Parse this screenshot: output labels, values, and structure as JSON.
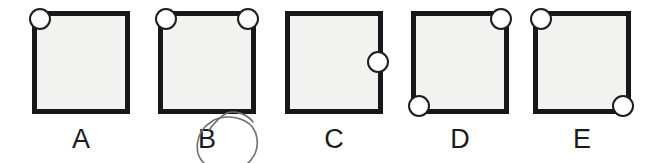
{
  "figure": {
    "type": "multiple-choice-diagram",
    "background_color": "#ffffff",
    "square": {
      "fill_color": "#f2f2f0",
      "border_color": "#18181a",
      "border_width_px": 5,
      "width_px": 98,
      "height_px": 103
    },
    "circle": {
      "fill_color": "#ffffff",
      "border_color": "#1d1d1f",
      "diameter_px": 22
    },
    "annotation": {
      "name": "hand-drawn-ellipse",
      "target_option": "B",
      "stroke_color": "#6f6f73",
      "stroke_width_px": 1.6
    },
    "options": [
      {
        "label": "A",
        "left_px": 32,
        "circle_positions": [
          "top-left"
        ],
        "circle_count": 1
      },
      {
        "label": "B",
        "left_px": 158,
        "circle_positions": [
          "top-left",
          "top-right"
        ],
        "circle_count": 2,
        "annotated": true
      },
      {
        "label": "C",
        "left_px": 285,
        "circle_positions": [
          "right-middle"
        ],
        "circle_count": 1
      },
      {
        "label": "D",
        "left_px": 411,
        "circle_positions": [
          "top-right",
          "bottom-left"
        ],
        "circle_count": 2
      },
      {
        "label": "E",
        "left_px": 533,
        "circle_positions": [
          "top-left",
          "bottom-right"
        ],
        "circle_count": 2
      }
    ]
  }
}
